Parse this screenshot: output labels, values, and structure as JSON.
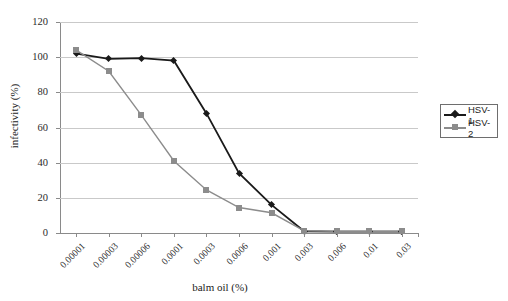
{
  "chart_data": {
    "type": "line",
    "title": "",
    "xlabel": "balm oil (%)",
    "ylabel": "infectivity (%)",
    "categories": [
      "0.00001",
      "0.00003",
      "0.00006",
      "0.0001",
      "0.0003",
      "0.0006",
      "0.001",
      "0.003",
      "0.006",
      "0.01",
      "0.03"
    ],
    "ytick_labels": [
      "0",
      "20",
      "40",
      "60",
      "80",
      "100",
      "120"
    ],
    "ylim": [
      0,
      120
    ],
    "grid": "horizontal",
    "legend_position": "right",
    "series": [
      {
        "name": "HSV-1",
        "color": "#1a1a1a",
        "marker": "diamond",
        "values": [
          102,
          99,
          99.5,
          98,
          68,
          34,
          16,
          1,
          0.8,
          0.8,
          0.8
        ]
      },
      {
        "name": "HSV-2",
        "color": "#8c8c8c",
        "marker": "square",
        "values": [
          104,
          92,
          67,
          41,
          24.5,
          14.5,
          11.5,
          1.2,
          1,
          1,
          1
        ]
      }
    ]
  },
  "legend": {
    "items": [
      {
        "label": "HSV-1"
      },
      {
        "label": "HSV-2"
      }
    ]
  },
  "axes": {
    "x_title": "balm oil (%)",
    "y_title": "infectivity (%)"
  }
}
